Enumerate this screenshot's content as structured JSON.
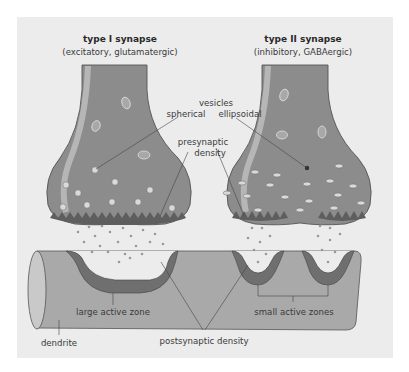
{
  "type1": {
    "title": "type I synapse",
    "subtitle": "(excitatory, glutamatergic)"
  },
  "type2": {
    "title": "type II synapse",
    "subtitle": "(inhibitory, GABAergic)"
  },
  "labels": {
    "vesicles": "vesicles",
    "spherical": "spherical",
    "ellipsoidal": "ellipsoidal",
    "presynaptic_1": "presynaptic",
    "presynaptic_2": "density",
    "large_active_zone": "large active zone",
    "small_active_zones": "small active zones",
    "dendrite": "dendrite",
    "postsynaptic_density": "postsynaptic density"
  },
  "colors": {
    "background": "#ececec",
    "terminal": "#8c8c8c",
    "terminal_highlight": "#c8c8c8",
    "dendrite": "#a9a9a9",
    "active_zone": "#6f6f6f",
    "vesicle": "#d9d9d9"
  }
}
